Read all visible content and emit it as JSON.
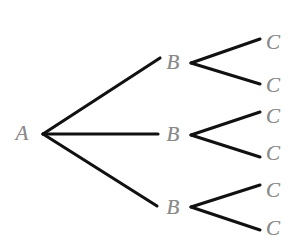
{
  "diagram": {
    "type": "probability-tree-diagram",
    "background_color": "#ffffff",
    "edge_color": "#111111",
    "label_color": "#8a8a8a",
    "width": 305,
    "height": 236,
    "root": {
      "id": "A",
      "label": "A",
      "x": 22,
      "y": 133
    },
    "level_b": [
      {
        "id": "B1",
        "label": "B",
        "x": 173,
        "y": 62
      },
      {
        "id": "B2",
        "label": "B",
        "x": 173,
        "y": 134
      },
      {
        "id": "B3",
        "label": "B",
        "x": 173,
        "y": 207
      }
    ],
    "level_c": [
      {
        "id": "C1",
        "label": "C",
        "x": 273,
        "y": 42,
        "parent": "B1"
      },
      {
        "id": "C2",
        "label": "C",
        "x": 273,
        "y": 85,
        "parent": "B1"
      },
      {
        "id": "C3",
        "label": "C",
        "x": 273,
        "y": 116,
        "parent": "B2"
      },
      {
        "id": "C4",
        "label": "C",
        "x": 273,
        "y": 153,
        "parent": "B2"
      },
      {
        "id": "C5",
        "label": "C",
        "x": 273,
        "y": 190,
        "parent": "B3"
      },
      {
        "id": "C6",
        "label": "C",
        "x": 273,
        "y": 228,
        "parent": "B3"
      }
    ],
    "edges": [
      {
        "id": "edge-a-b1",
        "from": "A",
        "to": "B1",
        "x1": 43,
        "y1": 134,
        "x2": 160,
        "y2": 58
      },
      {
        "id": "edge-a-b2",
        "from": "A",
        "to": "B2",
        "x1": 43,
        "y1": 134,
        "x2": 158,
        "y2": 134
      },
      {
        "id": "edge-a-b3",
        "from": "A",
        "to": "B3",
        "x1": 43,
        "y1": 134,
        "x2": 157,
        "y2": 206
      },
      {
        "id": "edge-b1-c1",
        "from": "B1",
        "to": "C1",
        "x1": 191,
        "y1": 63,
        "x2": 260,
        "y2": 39
      },
      {
        "id": "edge-b1-c2",
        "from": "B1",
        "to": "C2",
        "x1": 191,
        "y1": 63,
        "x2": 260,
        "y2": 84
      },
      {
        "id": "edge-b2-c3",
        "from": "B2",
        "to": "C3",
        "x1": 191,
        "y1": 135,
        "x2": 260,
        "y2": 112
      },
      {
        "id": "edge-b2-c4",
        "from": "B2",
        "to": "C4",
        "x1": 191,
        "y1": 135,
        "x2": 260,
        "y2": 157
      },
      {
        "id": "edge-b3-c5",
        "from": "B3",
        "to": "C5",
        "x1": 191,
        "y1": 207,
        "x2": 260,
        "y2": 185
      },
      {
        "id": "edge-b3-c6",
        "from": "B3",
        "to": "C6",
        "x1": 191,
        "y1": 207,
        "x2": 260,
        "y2": 230
      }
    ]
  }
}
